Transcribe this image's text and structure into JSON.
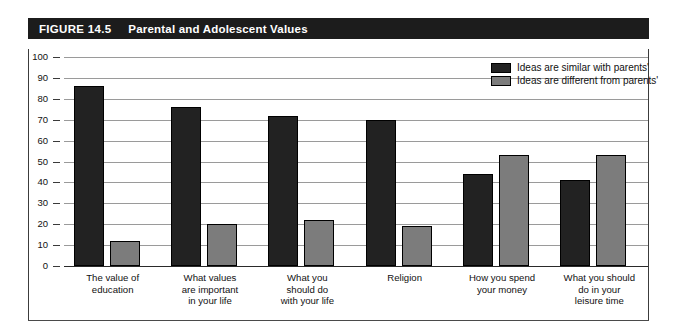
{
  "figure": {
    "number": "FIGURE 14.5",
    "title": "Parental and Adolescent Values"
  },
  "legend": {
    "position": "top-right",
    "items": [
      {
        "label": "Ideas are similar with parents'",
        "color": "#222222",
        "key": "similar"
      },
      {
        "label": "Ideas are different from parents'",
        "color": "#7c7c7c",
        "key": "different"
      }
    ]
  },
  "axis": {
    "y_ticks": [
      "100",
      "90",
      "80",
      "70",
      "60",
      "50",
      "40",
      "30",
      "20",
      "10",
      "0"
    ]
  },
  "chart_data": {
    "type": "bar",
    "title": "Parental and Adolescent Values",
    "xlabel": "",
    "ylabel": "",
    "ylim": [
      0,
      100
    ],
    "ytick_step": 10,
    "grid": true,
    "legend_position": "top-right",
    "categories": [
      "The value of\neducation",
      "What values\nare important\nin your life",
      "What you\nshould do\nwith your life",
      "Religion",
      "How you spend\nyour money",
      "What you should\ndo in your\nleisure time"
    ],
    "series": [
      {
        "name": "Ideas are similar with parents'",
        "color": "#222222",
        "values": [
          86,
          76,
          72,
          70,
          44,
          41
        ]
      },
      {
        "name": "Ideas are different from parents'",
        "color": "#7c7c7c",
        "values": [
          12,
          20,
          22,
          19,
          53,
          53
        ]
      }
    ]
  }
}
